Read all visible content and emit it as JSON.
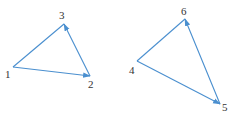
{
  "diagram": {
    "edge_color": "#4a8fcf",
    "label_color": "#333333",
    "graphs": [
      {
        "name": "left-triangle",
        "nodes": [
          {
            "id": "1",
            "label": "1",
            "x": 13,
            "y": 67,
            "lx": 5,
            "ly": 78
          },
          {
            "id": "2",
            "label": "2",
            "x": 90,
            "y": 76,
            "lx": 88,
            "ly": 88
          },
          {
            "id": "3",
            "label": "3",
            "x": 64,
            "y": 24,
            "lx": 59,
            "ly": 19
          }
        ],
        "edges": [
          {
            "from": "1",
            "to": "2",
            "arrow": true
          },
          {
            "from": "2",
            "to": "3",
            "arrow": true
          },
          {
            "from": "1",
            "to": "3",
            "arrow": false
          }
        ]
      },
      {
        "name": "right-triangle",
        "nodes": [
          {
            "id": "4",
            "label": "4",
            "x": 137,
            "y": 61,
            "lx": 129,
            "ly": 74
          },
          {
            "id": "5",
            "label": "5",
            "x": 220,
            "y": 104,
            "lx": 222,
            "ly": 111
          },
          {
            "id": "6",
            "label": "6",
            "x": 185,
            "y": 19,
            "lx": 181,
            "ly": 15
          }
        ],
        "edges": [
          {
            "from": "4",
            "to": "5",
            "arrow": true
          },
          {
            "from": "5",
            "to": "6",
            "arrow": true
          },
          {
            "from": "4",
            "to": "6",
            "arrow": false
          }
        ]
      }
    ]
  }
}
